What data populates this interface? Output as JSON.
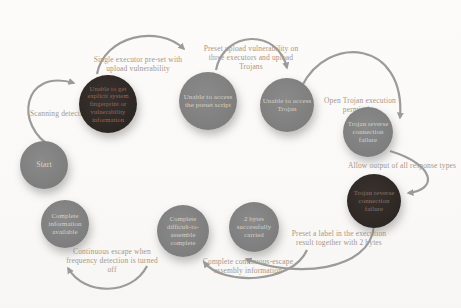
{
  "diagram": {
    "nodes": [
      {
        "id": "start",
        "label": "Start",
        "style": "gray"
      },
      {
        "id": "no-fingerprint",
        "label": "Unable to get explicit system fingerprint or vulnerability information",
        "style": "dark"
      },
      {
        "id": "no-preset-script",
        "label": "Unable to access the preset script",
        "style": "gray"
      },
      {
        "id": "no-trojan-access",
        "label": "Unable to access Trojan",
        "style": "gray"
      },
      {
        "id": "trojan-reverse-failure-1",
        "label": "Trojan reverse connection failure",
        "style": "gray"
      },
      {
        "id": "trojan-reverse-failure-2",
        "label": "Trojan reverse connection failure",
        "style": "dark"
      },
      {
        "id": "two-bytes-carried",
        "label": "2 bytes successfully carried",
        "style": "gray"
      },
      {
        "id": "difficult-assemble",
        "label": "Complete difficult-to-assemble complete",
        "style": "gray"
      },
      {
        "id": "info-available",
        "label": "Complete information available",
        "style": "gray"
      }
    ],
    "edges": [
      {
        "from": "start",
        "to": "no-fingerprint",
        "label": "Scanning detection"
      },
      {
        "from": "no-fingerprint",
        "to": "no-preset-script",
        "label": "Single executor pre-set with upload vulnerability"
      },
      {
        "from": "no-preset-script",
        "to": "no-trojan-access",
        "label": "Preset upload vulnerability on three executors and upload Trojans"
      },
      {
        "from": "no-trojan-access",
        "to": "trojan-reverse-failure-1",
        "label": "Open Trojan execution permission"
      },
      {
        "from": "trojan-reverse-failure-1",
        "to": "trojan-reverse-failure-2",
        "label": "Allow output of all response types"
      },
      {
        "from": "trojan-reverse-failure-2",
        "to": "two-bytes-carried",
        "label": "Preset a label in the execution result together with 2 bytes"
      },
      {
        "from": "two-bytes-carried",
        "to": "difficult-assemble",
        "label": "Complete continuous-escape assembly information"
      },
      {
        "from": "difficult-assemble",
        "to": "info-available",
        "label": "Continuous escape when frequency detection is turned off"
      }
    ],
    "colors": {
      "gray_node": "#7e7e7e",
      "dark_node": "#2d2724",
      "gray_node_text": "#d9d2c8",
      "dark_node_text_red": "#97695a",
      "dark_node_text_gray": "#8d7468",
      "edge_label_text": "#a5978a",
      "arrow": "#9b9b9b",
      "background": "#fbfaf8"
    }
  }
}
